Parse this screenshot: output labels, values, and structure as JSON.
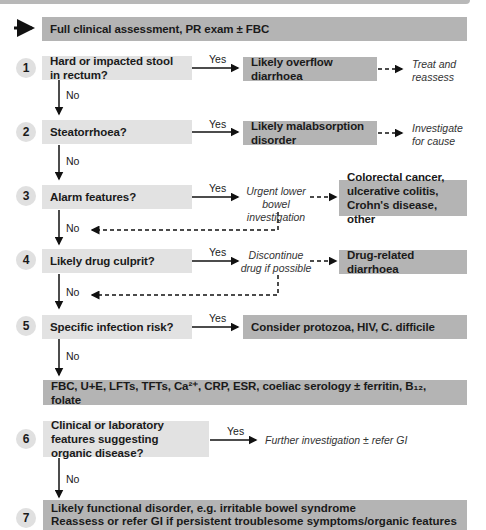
{
  "flowchart": {
    "start": "Full clinical assessment, PR exam ± FBC",
    "steps": [
      {
        "num": "1",
        "question": "Hard or impacted stool in rectum?",
        "yes": "Yes",
        "no": "No",
        "outcome": "Likely overflow diarrhoea",
        "action": "Treat and reassess"
      },
      {
        "num": "2",
        "question": "Steatorrhoea?",
        "yes": "Yes",
        "no": "No",
        "outcome": "Likely malabsorption disorder",
        "action": "Investigate for cause"
      },
      {
        "num": "3",
        "question": "Alarm features?",
        "yes": "Yes",
        "no": "No",
        "action": "Urgent lower bowel investigation",
        "outcome": "Colorectal cancer, ulcerative colitis, Crohn's disease, other"
      },
      {
        "num": "4",
        "question": "Likely drug culprit?",
        "yes": "Yes",
        "no": "No",
        "action": "Discontinue drug if possible",
        "outcome": "Drug-related diarrhoea"
      },
      {
        "num": "5",
        "question": "Specific infection risk?",
        "yes": "Yes",
        "no": "No",
        "outcome": "Consider protozoa, HIV, C. difficile"
      },
      {
        "num": "6",
        "question": "Clinical or laboratory features suggesting organic disease?",
        "yes": "Yes",
        "no": "No",
        "action": "Further investigation ± refer GI"
      },
      {
        "num": "7",
        "outcome_line1": "Likely functional disorder, e.g. irritable bowel syndrome",
        "outcome_line2": "Reassess or refer GI if persistent troublesome symptoms/organic features"
      }
    ],
    "tests": "FBC, U+E, LFTs, TFTs, Ca²⁺, CRP, ESR, coeliac serology ± ferritin, B₁₂, folate",
    "colors": {
      "dark_box": "#b4b4b4",
      "light_box": "#e2e2e2",
      "number_circle": "#e0e0e0"
    }
  }
}
